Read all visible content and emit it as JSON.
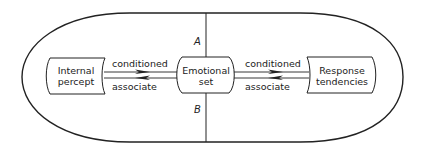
{
  "diagram": {
    "regions": {
      "top": "A",
      "bottom": "B"
    },
    "nodes": [
      {
        "id": "internal-percept",
        "line1": "Internal",
        "line2": "percept"
      },
      {
        "id": "emotional-set",
        "line1": "Emotional",
        "line2": "set"
      },
      {
        "id": "response-tendencies",
        "line1": "Response",
        "line2": "tendencies"
      }
    ],
    "edges": [
      {
        "from": "internal-percept",
        "to": "emotional-set",
        "label": "conditioned"
      },
      {
        "from": "emotional-set",
        "to": "internal-percept",
        "label": "associate"
      },
      {
        "from": "emotional-set",
        "to": "response-tendencies",
        "label": "conditioned"
      },
      {
        "from": "response-tendencies",
        "to": "emotional-set",
        "label": "associate"
      }
    ],
    "colors": {
      "stroke": "#222222",
      "background": "#ffffff"
    }
  }
}
